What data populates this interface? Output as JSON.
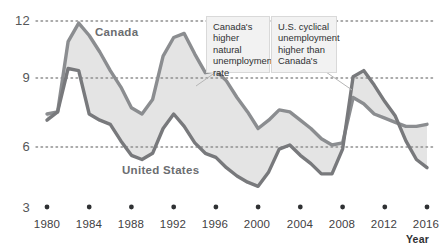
{
  "chart_data": {
    "type": "line",
    "title": "",
    "xlabel": "Year",
    "ylabel": "",
    "xlim": [
      1980,
      2016
    ],
    "ylim": [
      3,
      12
    ],
    "grid": "dotted horizontal gridlines at 12, 9 and 6",
    "y_ticks": [
      "12",
      "9",
      "6",
      "3"
    ],
    "y_tick_values": [
      12,
      9,
      6,
      3
    ],
    "x_ticks": [
      "1980",
      "1984",
      "1988",
      "1992",
      "1996",
      "2000",
      "2004",
      "2008",
      "2012",
      "2016"
    ],
    "x_tick_values": [
      1980,
      1984,
      1988,
      1992,
      1996,
      2000,
      2004,
      2008,
      2012,
      2016
    ],
    "legend_position": "inline labels on the plot",
    "fill_between": true,
    "fill_color": "#e2e2e2",
    "line_color": "#8b8d90",
    "series": [
      {
        "name": "Canada",
        "x": [
          1980,
          1981,
          1982,
          1983,
          1984,
          1985,
          1986,
          1987,
          1988,
          1989,
          1990,
          1991,
          1992,
          1993,
          1994,
          1995,
          1996,
          1997,
          1998,
          1999,
          2000,
          2001,
          2002,
          2003,
          2004,
          2005,
          2006,
          2007,
          2008,
          2009,
          2010,
          2011,
          2012,
          2013,
          2014,
          2015,
          2016
        ],
        "values": [
          7.5,
          7.6,
          11.0,
          11.9,
          11.3,
          10.5,
          9.6,
          8.8,
          7.8,
          7.5,
          8.2,
          10.3,
          11.2,
          11.4,
          10.4,
          9.5,
          9.6,
          9.1,
          8.3,
          7.6,
          6.8,
          7.2,
          7.7,
          7.6,
          7.2,
          6.8,
          6.3,
          6.0,
          6.1,
          8.3,
          8.0,
          7.5,
          7.3,
          7.1,
          6.9,
          6.9,
          7.0
        ]
      },
      {
        "name": "United States",
        "x": [
          1980,
          1981,
          1982,
          1983,
          1984,
          1985,
          1986,
          1987,
          1988,
          1989,
          1990,
          1991,
          1992,
          1993,
          1994,
          1995,
          1996,
          1997,
          1998,
          1999,
          2000,
          2001,
          2002,
          2003,
          2004,
          2005,
          2006,
          2007,
          2008,
          2009,
          2010,
          2011,
          2012,
          2013,
          2014,
          2015,
          2016
        ],
        "values": [
          7.2,
          7.6,
          9.7,
          9.6,
          7.5,
          7.2,
          7.0,
          6.2,
          5.5,
          5.3,
          5.6,
          6.8,
          7.5,
          6.9,
          6.1,
          5.6,
          5.4,
          4.9,
          4.5,
          4.2,
          4.0,
          4.7,
          5.8,
          6.0,
          5.5,
          5.1,
          4.6,
          4.6,
          5.8,
          9.3,
          9.6,
          8.9,
          8.1,
          7.4,
          6.2,
          5.3,
          4.9
        ]
      }
    ],
    "annotations": [
      {
        "id": "note-natural-rate",
        "lines": [
          "Canada's",
          "higher natural",
          "unemployment",
          "rate"
        ]
      },
      {
        "id": "note-cyclical",
        "lines": [
          "U.S. cyclical",
          "unemployment",
          "higher than",
          "Canada's"
        ]
      }
    ]
  },
  "axis": {
    "x_name": "Year"
  },
  "labels": {
    "canada": "Canada",
    "united_states": "United States"
  },
  "notes": {
    "left_l1": "Canada's",
    "left_l2": "higher natural",
    "left_l3": "unemployment",
    "left_l4": "rate",
    "right_l1": "U.S. cyclical",
    "right_l2": "unemployment",
    "right_l3": "higher than",
    "right_l4": "Canada's"
  },
  "ticks": {
    "y": [
      "12",
      "9",
      "6",
      "3"
    ],
    "x": [
      "1980",
      "1984",
      "1988",
      "1992",
      "1996",
      "2000",
      "2004",
      "2008",
      "2012",
      "2016"
    ]
  },
  "colors": {
    "line": "#8b8d90",
    "fill": "#e2e2e2",
    "grid": "#9a9a9a",
    "text": "#3f4143"
  }
}
